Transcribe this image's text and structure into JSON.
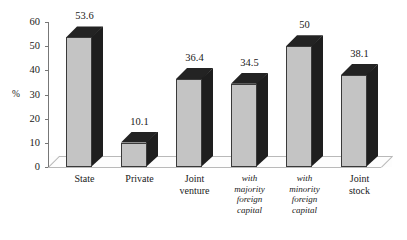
{
  "chart_data": {
    "type": "bar",
    "title": "",
    "subtitle": "",
    "xlabel": "",
    "ylabel": "%",
    "ylim": [
      0,
      60
    ],
    "ytick_step": 10,
    "yticks": [
      0,
      10,
      20,
      30,
      40,
      50,
      60
    ],
    "ytick_labels": [
      "0",
      "10",
      "20",
      "30",
      "40",
      "50",
      "60"
    ],
    "grid": false,
    "legend": "none",
    "style": "3d-column",
    "categories": [
      "State",
      "Private",
      "Joint\nventure",
      "with\nmajority\nforeign\ncapital",
      "with\nminority\nforeign\ncapital",
      "Joint\nstock"
    ],
    "category_styles": [
      "normal",
      "normal",
      "normal",
      "italic",
      "italic",
      "normal"
    ],
    "values": [
      53.6,
      10.1,
      36.4,
      34.5,
      50,
      38.1
    ],
    "value_labels": [
      "53.6",
      "10.1",
      "36.4",
      "34.5",
      "50",
      "38.1"
    ],
    "colors": {
      "bar_front": "#c4c4c4",
      "bar_side": "#1e1e1e",
      "bar_top": "#232323",
      "axis": "#777777",
      "text": "#1a1a1a",
      "background": "#ffffff",
      "floor": "#fdfdfd"
    }
  }
}
